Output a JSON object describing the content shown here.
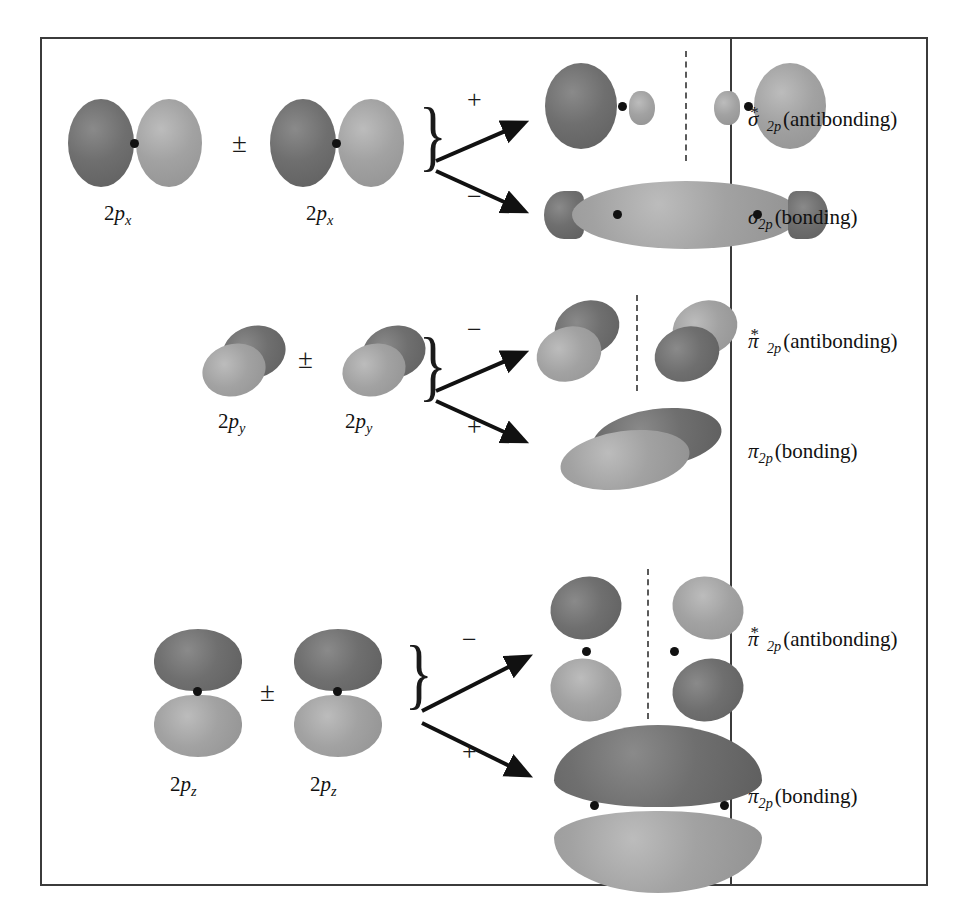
{
  "figure": {
    "type": "molecular-orbital-formation-diagram",
    "ghost_text_above": "",
    "colors": {
      "lobe_dark": "#6f6f6f",
      "lobe_light": "#a2a2a2",
      "nucleus": "#111111",
      "frame": "#3b3b3b",
      "node_plane": "#5a5a5a"
    },
    "combine_symbol": "±"
  },
  "rows": [
    {
      "id": "sigma-2p",
      "atomic_orbital_label": "2p",
      "atomic_orbital_subscript": "x",
      "atomic_orbital_full": "2px",
      "orientation": "head-on along internuclear axis",
      "combination_signs": [
        "+",
        "−"
      ],
      "results": [
        {
          "sign": "+",
          "greek": "σ",
          "star": "*",
          "subscript": "2p",
          "type": "(antibonding)",
          "full_label": "σ*2p (antibonding)",
          "has_node_plane": true
        },
        {
          "sign": "−",
          "greek": "σ",
          "star": "",
          "subscript": "2p",
          "type": "(bonding)",
          "full_label": "σ2p (bonding)",
          "has_node_plane": false
        }
      ]
    },
    {
      "id": "pi-2py",
      "atomic_orbital_label": "2p",
      "atomic_orbital_subscript": "y",
      "atomic_orbital_full": "2py",
      "orientation": "side-by-side, viewed obliquely",
      "combination_signs": [
        "−",
        "+"
      ],
      "results": [
        {
          "sign": "−",
          "greek": "π",
          "star": "*",
          "subscript": "2p",
          "type": "(antibonding)",
          "full_label": "π*2p (antibonding)",
          "has_node_plane": true
        },
        {
          "sign": "+",
          "greek": "π",
          "star": "",
          "subscript": "2p",
          "type": "(bonding)",
          "full_label": "π2p (bonding)",
          "has_node_plane": false
        }
      ]
    },
    {
      "id": "pi-2pz",
      "atomic_orbital_label": "2p",
      "atomic_orbital_subscript": "z",
      "atomic_orbital_full": "2pz",
      "orientation": "side-by-side, perpendicular to page plane",
      "combination_signs": [
        "−",
        "+"
      ],
      "results": [
        {
          "sign": "−",
          "greek": "π",
          "star": "*",
          "subscript": "2p",
          "type": "(antibonding)",
          "full_label": "π*2p (antibonding)",
          "has_node_plane": true
        },
        {
          "sign": "+",
          "greek": "π",
          "star": "",
          "subscript": "2p",
          "type": "(bonding)",
          "full_label": "π2p (bonding)",
          "has_node_plane": false
        }
      ]
    }
  ]
}
